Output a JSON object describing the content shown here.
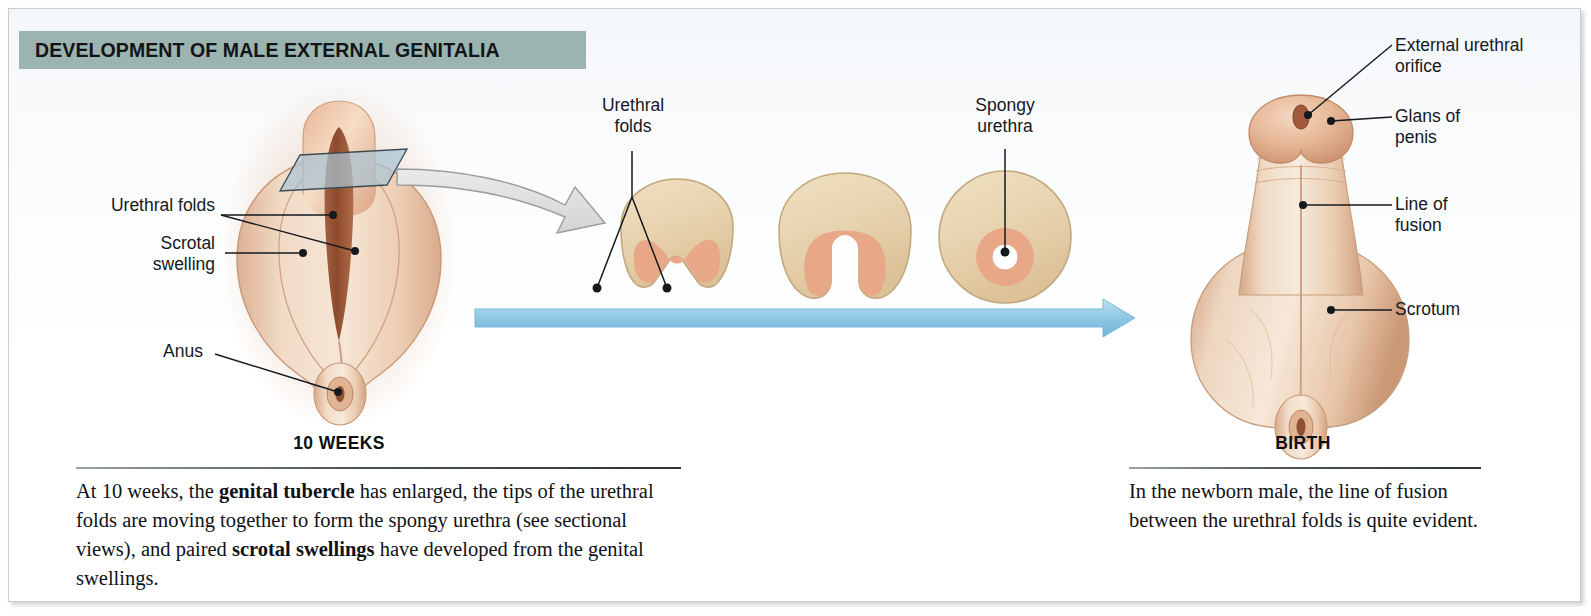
{
  "title": "DEVELOPMENT OF MALE EXTERNAL GENITALIA",
  "colors": {
    "banner": "#9cb4af",
    "progress_arrow": "#9fd0e8",
    "section_plane": "#a9c3d2",
    "tissue_light": "#e8d3b4",
    "tissue_mid": "#e0b28a",
    "urethra_pink": "#e6a183",
    "skin_light": "#f0d9c4",
    "skin_mid": "#e0b694",
    "leader_line": "#1b1d20"
  },
  "left_figure": {
    "stage_label": "10 WEEKS",
    "labels": [
      {
        "text": "Urethral folds",
        "align": "right"
      },
      {
        "text": "Scrotal\nswelling",
        "align": "right"
      },
      {
        "text": "Anus",
        "align": "right"
      }
    ],
    "caption_parts": [
      {
        "text": "At 10 weeks, the ",
        "bold": false
      },
      {
        "text": "genital tubercle",
        "bold": true
      },
      {
        "text": " has enlarged, the tips of the urethral folds are moving together to form the spongy urethra (see sectional views), and paired ",
        "bold": false
      },
      {
        "text": "scrotal swellings",
        "bold": true
      },
      {
        "text": " have developed from the genital swellings.",
        "bold": false
      }
    ]
  },
  "center_sections": {
    "labels": [
      {
        "text": "Urethral\nfolds",
        "align": "center"
      },
      {
        "text": "Spongy\nurethra",
        "align": "center"
      }
    ],
    "section_count": 3,
    "section_names": [
      "open-urethral-groove",
      "closing-urethral-groove",
      "closed-spongy-urethra"
    ]
  },
  "right_figure": {
    "stage_label": "BIRTH",
    "labels": [
      {
        "text": "External urethral\norifice",
        "align": "left"
      },
      {
        "text": "Glans of\npenis",
        "align": "left"
      },
      {
        "text": "Line of\nfusion",
        "align": "left"
      },
      {
        "text": "Scrotum",
        "align": "left"
      }
    ],
    "caption_parts": [
      {
        "text": "In the newborn male, the line of fusion between the urethral folds is quite evident.",
        "bold": false
      }
    ]
  }
}
